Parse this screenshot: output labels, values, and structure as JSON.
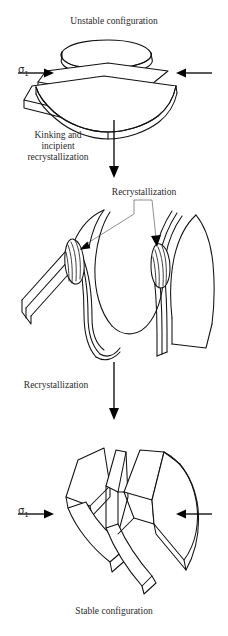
{
  "figure": {
    "title_top": "Unstable configuration",
    "title_bottom": "Stable configuration",
    "stress_symbol": "σ",
    "stress_subscript": "1",
    "steps": [
      {
        "id": "step-1",
        "label": "Kinking and\nincipient\nrecrystallization"
      },
      {
        "id": "step-2",
        "label": "Recrystallization"
      }
    ],
    "annotations": [
      {
        "id": "recrystallization-callout",
        "label": "Recrystallization"
      }
    ],
    "stages": [
      {
        "id": "stage-unstable",
        "caption": "Unstable configuration",
        "description": "stack of planar layers"
      },
      {
        "id": "stage-kinked",
        "caption": "",
        "description": "kinked layers with recrystallized lenses at hinges"
      },
      {
        "id": "stage-stable",
        "caption": "Stable configuration",
        "description": "chevron kink-folded layers"
      }
    ],
    "colors": {
      "ink": "#111111",
      "background": "#ffffff",
      "text": "#2a2a2a",
      "leader": "#444444"
    }
  }
}
